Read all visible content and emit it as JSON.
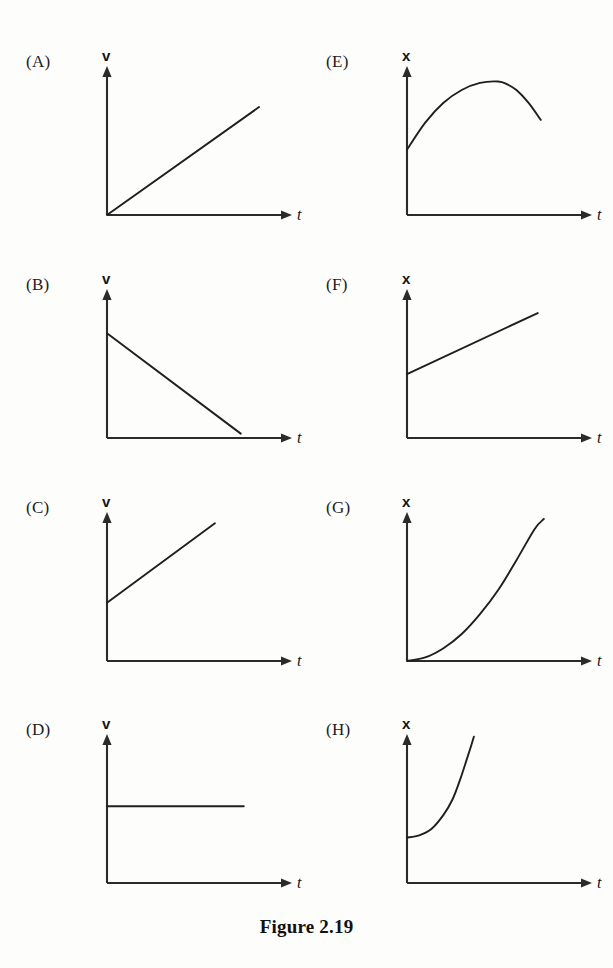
{
  "figure": {
    "caption": "Figure 2.19",
    "axis_color": "#2b2b2b",
    "curve_color": "#1f1f1f",
    "background_color": "#fdfdfc"
  },
  "chart_data": [
    {
      "id": "A",
      "type": "line",
      "panel_label": "(A)",
      "title": "",
      "xlabel": "t",
      "ylabel": "v",
      "xlim": [
        0,
        10
      ],
      "ylim": [
        0,
        10
      ],
      "grid": false,
      "description": "velocity increasing linearly from zero",
      "series": [
        {
          "name": "v(t)",
          "x": [
            0,
            10
          ],
          "values": [
            0,
            7.6
          ]
        }
      ]
    },
    {
      "id": "B",
      "type": "line",
      "panel_label": "(B)",
      "title": "",
      "xlabel": "t",
      "ylabel": "v",
      "xlim": [
        0,
        10
      ],
      "ylim": [
        -3,
        10
      ],
      "grid": false,
      "description": "velocity decreasing linearly, crossing zero into negative values",
      "series": [
        {
          "name": "v(t)",
          "x": [
            0,
            8.8
          ],
          "values": [
            6.6,
            -2.6
          ]
        }
      ]
    },
    {
      "id": "C",
      "type": "line",
      "panel_label": "(C)",
      "title": "",
      "xlabel": "t",
      "ylabel": "v",
      "xlim": [
        0,
        10
      ],
      "ylim": [
        0,
        10
      ],
      "grid": false,
      "description": "velocity increasing linearly from a positive initial value, steep slope",
      "series": [
        {
          "name": "v(t)",
          "x": [
            0,
            7.1
          ],
          "values": [
            4.1,
            9.7
          ]
        }
      ]
    },
    {
      "id": "D",
      "type": "line",
      "panel_label": "(D)",
      "title": "",
      "xlabel": "t",
      "ylabel": "v",
      "xlim": [
        0,
        10
      ],
      "ylim": [
        0,
        10
      ],
      "grid": false,
      "description": "constant positive velocity",
      "series": [
        {
          "name": "v(t)",
          "x": [
            0,
            9.0
          ],
          "values": [
            5.4,
            5.4
          ]
        }
      ]
    },
    {
      "id": "E",
      "type": "line",
      "panel_label": "(E)",
      "title": "",
      "xlabel": "t",
      "ylabel": "x",
      "xlim": [
        0,
        10
      ],
      "ylim": [
        0,
        10
      ],
      "grid": false,
      "description": "position rising to a maximum then falling, downward-opening parabola",
      "series": [
        {
          "name": "x(t)",
          "x": [
            0,
            1.2,
            2.4,
            3.6,
            4.8,
            6.0,
            6.6,
            7.2,
            8.0,
            8.8
          ],
          "values": [
            4.6,
            6.5,
            7.9,
            8.8,
            9.3,
            9.4,
            9.2,
            8.8,
            7.9,
            6.7
          ]
        }
      ]
    },
    {
      "id": "F",
      "type": "line",
      "panel_label": "(F)",
      "title": "",
      "xlabel": "t",
      "ylabel": "x",
      "xlim": [
        0,
        10
      ],
      "ylim": [
        0,
        10
      ],
      "grid": false,
      "description": "position increasing linearly from a positive initial value, gentle slope",
      "series": [
        {
          "name": "x(t)",
          "x": [
            0,
            8.6
          ],
          "values": [
            4.5,
            8.8
          ]
        }
      ]
    },
    {
      "id": "G",
      "type": "line",
      "panel_label": "(G)",
      "title": "",
      "xlabel": "t",
      "ylabel": "x",
      "xlim": [
        0,
        10
      ],
      "ylim": [
        0,
        10
      ],
      "grid": false,
      "description": "position increasing from zero with upward curvature, parabola",
      "series": [
        {
          "name": "x(t)",
          "x": [
            0,
            1.2,
            2.4,
            3.6,
            4.8,
            6.0,
            7.2,
            8.4,
            9.0
          ],
          "values": [
            0,
            0.25,
            0.9,
            1.9,
            3.3,
            5.0,
            7.1,
            9.3,
            10.0
          ]
        }
      ]
    },
    {
      "id": "H",
      "type": "line",
      "panel_label": "(H)",
      "title": "",
      "xlabel": "t",
      "ylabel": "x",
      "xlim": [
        0,
        10
      ],
      "ylim": [
        0,
        10
      ],
      "grid": false,
      "description": "position nearly flat then rising very steeply, exponential-like growth",
      "series": [
        {
          "name": "x(t)",
          "x": [
            0,
            0.8,
            1.6,
            2.4,
            3.0,
            3.5,
            3.9,
            4.2,
            4.4
          ],
          "values": [
            3.2,
            3.35,
            3.8,
            4.8,
            5.9,
            7.3,
            8.6,
            9.6,
            10.3
          ]
        }
      ]
    }
  ]
}
